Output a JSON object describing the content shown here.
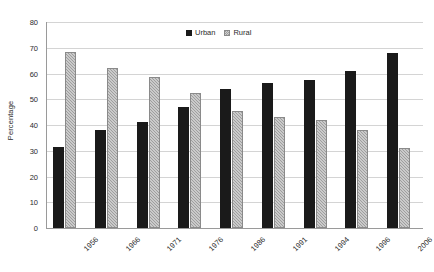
{
  "chart_data": {
    "type": "bar",
    "title": "",
    "xlabel": "",
    "ylabel": "Percentage",
    "ylim": [
      0,
      80
    ],
    "yticks": [
      0,
      10,
      20,
      30,
      40,
      50,
      60,
      70,
      80
    ],
    "grid": true,
    "legend_position": "top-center",
    "categories": [
      "1956",
      "1966",
      "1971",
      "1976",
      "1986",
      "1991",
      "1994",
      "1996",
      "2006"
    ],
    "series": [
      {
        "name": "Urban",
        "color": "#1a1a1a",
        "values": [
          31.5,
          38,
          41,
          47,
          54,
          56.5,
          57.5,
          61,
          68
        ]
      },
      {
        "name": "Rural",
        "color": "#9e9e9e",
        "values": [
          68.5,
          62,
          58.5,
          52.5,
          45.5,
          43,
          42,
          38,
          31
        ]
      }
    ]
  },
  "axis": {
    "y_title": "Percentage"
  },
  "legend": {
    "items": [
      {
        "label": "Urban"
      },
      {
        "label": "Rural"
      }
    ]
  }
}
